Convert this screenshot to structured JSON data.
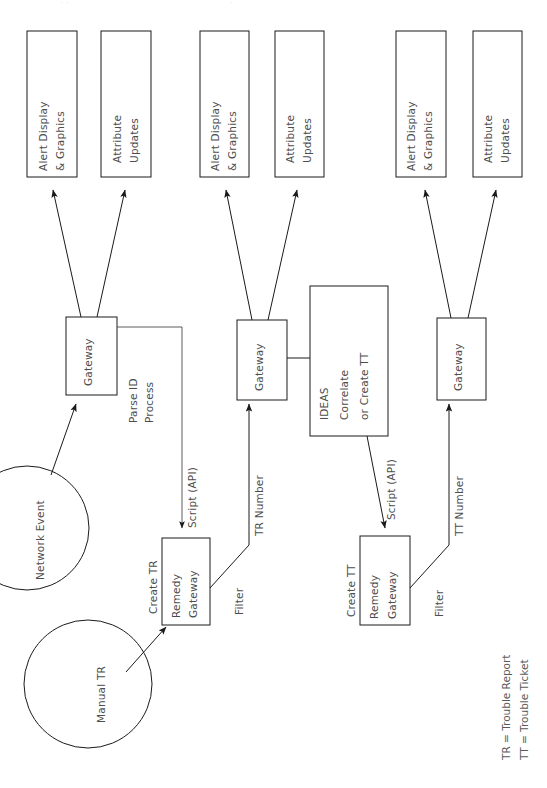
{
  "diagram": {
    "orientation": "rotated-90-ccw",
    "background_color": "#ffffff",
    "line_color": "#1a1a1a",
    "text_color": "#4d4d4d"
  },
  "sources": [
    {
      "id": "network-event",
      "label": "Network Event",
      "shape": "circle"
    },
    {
      "id": "manual-tr",
      "label": "Manual TR",
      "shape": "circle"
    }
  ],
  "stage1": {
    "outputs": [
      {
        "id": "alert-display-1",
        "line1": "Alert Display",
        "line2": "& Graphics"
      },
      {
        "id": "attribute-updates-1",
        "line1": "Attribute",
        "line2": "Updates"
      }
    ],
    "gateway": {
      "id": "gateway-1",
      "label": "Gateway"
    },
    "process_label": {
      "line1": "Parse ID",
      "line2": "Process"
    },
    "script_label": "Script (API)",
    "remedy": {
      "id": "remedy-gateway-1",
      "line1": "Remedy",
      "line2": "Gateway"
    },
    "create_label": "Create TR",
    "filter_label": "Filter",
    "number_label": "TR Number"
  },
  "stage2": {
    "outputs": [
      {
        "id": "alert-display-2",
        "line1": "Alert Display",
        "line2": "& Graphics"
      },
      {
        "id": "attribute-updates-2",
        "line1": "Attribute",
        "line2": "Updates"
      }
    ],
    "gateway": {
      "id": "gateway-2",
      "label": "Gateway"
    },
    "ideas": {
      "id": "ideas-box",
      "line1": "IDEAS",
      "line2": "Correlate",
      "line3": "or Create TT"
    },
    "script_label": "Script (API)",
    "remedy": {
      "id": "remedy-gateway-2",
      "line1": "Remedy",
      "line2": "Gateway"
    },
    "create_label": "Create TT",
    "filter_label": "Filter",
    "number_label": "TT Number"
  },
  "stage3": {
    "outputs": [
      {
        "id": "alert-display-3",
        "line1": "Alert Display",
        "line2": "& Graphics"
      },
      {
        "id": "attribute-updates-3",
        "line1": "Attribute",
        "line2": "Updates"
      }
    ],
    "gateway": {
      "id": "gateway-3",
      "label": "Gateway"
    }
  },
  "legend": {
    "line1": "TR = Trouble Report",
    "line2": "TT = Trouble Ticket"
  }
}
